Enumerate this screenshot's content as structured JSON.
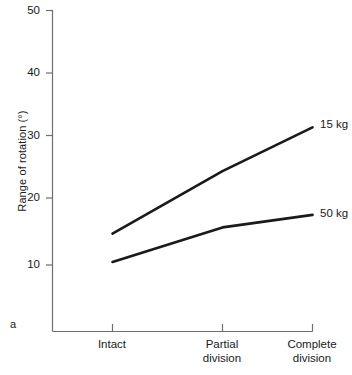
{
  "panel_label": "a",
  "chart_data": {
    "type": "line",
    "title": "",
    "xlabel": "",
    "ylabel": "Range of rotation (°)",
    "categories": [
      "Intact",
      "Partial division",
      "Complete division"
    ],
    "category_lines": [
      [
        "Intact"
      ],
      [
        "Partial",
        "division"
      ],
      [
        "Complete",
        "division"
      ]
    ],
    "yticks": [
      10,
      20,
      30,
      40,
      50
    ],
    "ylim": [
      0,
      50
    ],
    "grid": false,
    "legend_position": "right-of-line-ends",
    "series": [
      {
        "name": "15 kg",
        "values": [
          15,
          25,
          32
        ],
        "color": "#1a1a1a"
      },
      {
        "name": "50 kg",
        "values": [
          10.5,
          16,
          18
        ],
        "color": "#1a1a1a"
      }
    ]
  },
  "axis": {
    "y_label_text": "Range of rotation (°)",
    "tick_labels": [
      "50",
      "40",
      "30",
      "20",
      "10"
    ],
    "x_labels": [
      {
        "line1": "Intact",
        "line2": ""
      },
      {
        "line1": "Partial",
        "line2": "division"
      },
      {
        "line1": "Complete",
        "line2": "division"
      }
    ]
  },
  "series_labels": [
    {
      "text": "15 kg"
    },
    {
      "text": "50 kg"
    }
  ],
  "colors": {
    "line": "#1a1a1a",
    "axis": "#6f6f6f",
    "background": "#ffffff"
  }
}
